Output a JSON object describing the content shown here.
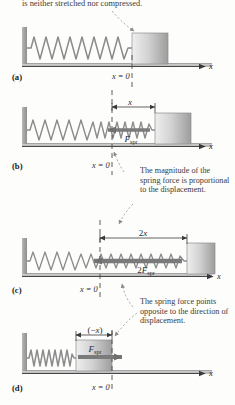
{
  "figure": {
    "type": "physics-diagram",
    "caption_top": "is neither stretched nor compressed.",
    "axis_label": "x",
    "origin_label_x": "x",
    "origin_label_eq": " = 0"
  },
  "annotations": {
    "b": "The magnitude of the spring force is proportional to the displacement.",
    "d": "The spring force points opposite to the direction of displacement."
  },
  "panels": [
    {
      "id": "a",
      "label": "(a)",
      "state": "relaxed",
      "origin_label": "x = 0",
      "displacement_label": "",
      "force_label": "",
      "block_position": "at equilibrium",
      "spring_coils": 11,
      "spring_state": "natural length",
      "axis_label": "x"
    },
    {
      "id": "b",
      "label": "(b)",
      "state": "stretched",
      "origin_label": "x = 0",
      "displacement_label": "x",
      "force_label": "F",
      "force_label_sub": "spr",
      "block_position": "displaced right by x",
      "spring_coils": 16,
      "spring_state": "stretched",
      "axis_label": "x"
    },
    {
      "id": "c",
      "label": "(c)",
      "state": "stretched twice",
      "origin_label": "x = 0",
      "displacement_label": "2x",
      "force_label": "2F",
      "force_label_sub": "spr",
      "block_position": "displaced right by 2x",
      "spring_coils": 22,
      "spring_state": "stretched twice as far",
      "axis_label": "x"
    },
    {
      "id": "d",
      "label": "(d)",
      "state": "compressed",
      "origin_label": "x = 0",
      "displacement_label": "(−x)",
      "force_label": "F",
      "force_label_sub": "spr",
      "block_position": "displaced left by x",
      "spring_coils": 12,
      "spring_state": "compressed",
      "axis_label": "x"
    }
  ],
  "colors": {
    "wall": "#9a9a9a",
    "floor": "#bdbdbd",
    "block_light": "#e4e4e4",
    "block_dark": "#a5a5a5",
    "spring": "#8d8d8d",
    "axis": "#3a3a3a",
    "dashed": "#4a4a4a",
    "arrow": "#7a7a7a",
    "text": "#2b2b2b"
  }
}
